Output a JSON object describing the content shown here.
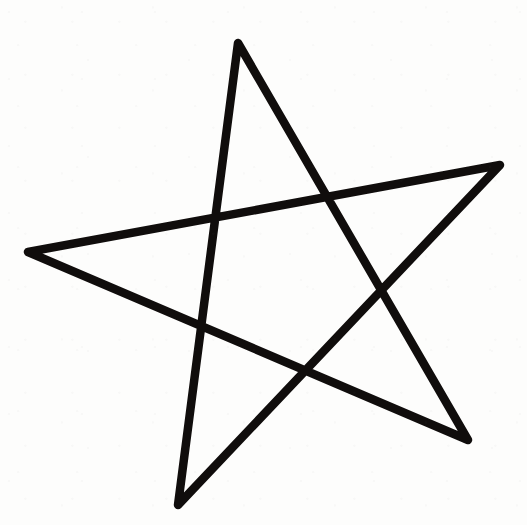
{
  "image": {
    "title": "Hand-drawn five-pointed star",
    "description": "A single continuous black line drawing of a five-pointed star (pentagram) on a plain white background.",
    "width": 527,
    "height": 525
  },
  "canvas": {
    "background_color": "#fdfdfc",
    "viewbox": "0 0 527 525"
  },
  "drawing": {
    "name": "five-pointed-star",
    "shape_type": "pentagram",
    "stroke_color": "#100d0c",
    "stroke_width": 8.5,
    "fill": "none",
    "stroke_linejoin": "round",
    "stroke_linecap": "round",
    "closed": true,
    "stroke_order": [
      "top-point",
      "bottom-right-point",
      "left-point",
      "right-point",
      "bottom-left-point"
    ],
    "path": "M 238 43 L 468 440 L 28 252 L 500 165 L 178 505 Z",
    "points": [
      {
        "name": "top-point",
        "x": 238,
        "y": 43
      },
      {
        "name": "right-point",
        "x": 500,
        "y": 165
      },
      {
        "name": "bottom-right-point",
        "x": 468,
        "y": 440
      },
      {
        "name": "bottom-left-point",
        "x": 178,
        "y": 505
      },
      {
        "name": "left-point",
        "x": 28,
        "y": 252
      }
    ],
    "intersections": [
      {
        "name": "upper-left-crossing",
        "x": 217,
        "y": 217
      },
      {
        "name": "upper-right-crossing",
        "x": 327,
        "y": 198
      },
      {
        "name": "right-crossing",
        "x": 378,
        "y": 287
      },
      {
        "name": "lower-left-crossing",
        "x": 202,
        "y": 325
      },
      {
        "name": "lower-center-crossing",
        "x": 300,
        "y": 367
      }
    ]
  }
}
